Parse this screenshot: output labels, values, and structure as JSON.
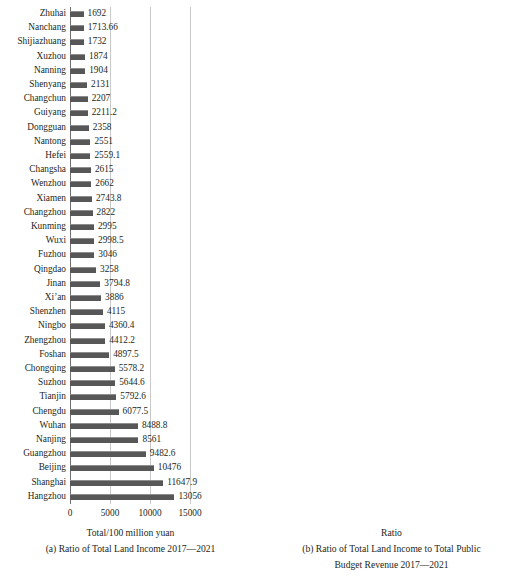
{
  "figure": {
    "width": 522,
    "height": 581,
    "bar_color": "#575757",
    "grid_color": "#c9c9c9",
    "axis_color": "#6f6f6f",
    "background": "#ffffff"
  },
  "chart_data": [
    {
      "type": "bar",
      "orientation": "horizontal",
      "panel": "a",
      "title": "",
      "xlabel": "Total/100 million yuan",
      "ylabel": "",
      "caption": "(a) Ratio of Total Land Income 2017—2021",
      "caption_line2": "",
      "xlim": [
        0,
        15000
      ],
      "xticks": [
        0,
        5000,
        10000,
        15000
      ],
      "xticklabels": [
        "0",
        "5000",
        "10000",
        "15000"
      ],
      "grid": true,
      "legend": "none",
      "categories": [
        "Zhuhai",
        "Nanchang",
        "Shijiazhuang",
        "Xuzhou",
        "Nanning",
        "Shenyang",
        "Changchun",
        "Guiyang",
        "Dongguan",
        "Nantong",
        "Hefei",
        "Changsha",
        "Wenzhou",
        "Xiamen",
        "Changzhou",
        "Kunming",
        "Wuxi",
        "Fuzhou",
        "Qingdao",
        "Jinan",
        "Xi’an",
        "Shenzhen",
        "Ningbo",
        "Zhengzhou",
        "Foshan",
        "Chongqing",
        "Suzhou",
        "Tianjin",
        "Chengdu",
        "Wuhan",
        "Nanjing",
        "Guangzhou",
        "Beijing",
        "Shanghai",
        "Hangzhou"
      ],
      "values": [
        1692,
        1713.66,
        1732,
        1874,
        1904,
        2131,
        2207,
        2211.2,
        2358,
        2551,
        2559.1,
        2615,
        2662,
        2743.8,
        2822,
        2995,
        2998.5,
        3046,
        3258,
        3794.8,
        3886,
        4115,
        4360.4,
        4412.2,
        4897.5,
        5578.2,
        5644.6,
        5792.6,
        6077.5,
        8488.8,
        8561,
        9482.6,
        10476,
        11647.9,
        13056
      ],
      "value_labels": [
        "1692",
        "1713.66",
        "1732",
        "1874",
        "1904",
        "2131",
        "2207",
        "2211.2",
        "2358",
        "2551",
        "2559.1",
        "2615",
        "2662",
        "2743.8",
        "2822",
        "2995",
        "2998.5",
        "3046",
        "3258",
        "3794.8",
        "3886",
        "4115",
        "4360.4",
        "4412.2",
        "4897.5",
        "5578.2",
        "5644.6",
        "5792.6",
        "6077.5",
        "8488.8",
        "8561",
        "9482.6",
        "10476",
        "11647.9",
        "13056"
      ]
    },
    {
      "type": "bar",
      "orientation": "horizontal",
      "panel": "b",
      "title": "",
      "xlabel": "Ratio",
      "ylabel": "",
      "caption": "(b) Ratio of Total Land Income to Total Public",
      "caption_line2": "Budget Revenue 2017—2021",
      "xlim": [
        0,
        1.5
      ],
      "xticks": [
        0,
        0.5,
        1.0,
        1.5
      ],
      "xticklabels": [
        "0.00",
        "0.50",
        "1.00",
        "1.50"
      ],
      "grid": true,
      "legend": "none",
      "categories": [
        "Shenzhen",
        "Shanghai",
        "Beijing",
        "Chongqing",
        "Suzhou",
        "Qingdao",
        "Changsha",
        "Tianjin",
        "Wuxi",
        "Shenyang",
        "Ningbo",
        "Shijiazhuang",
        "Dongguan",
        "Xiamen",
        "Xuzhou",
        "Zhengzhou",
        "Nanchang",
        "Nantong",
        "Hefei",
        "Chengdu",
        "Fuzhou",
        "Jinan",
        "Zhuhai",
        "Wenzhou",
        "Changzhou",
        "Kunming",
        "Changchun",
        "Nanning",
        "Xi’an",
        "Guiyang",
        "Nanjing",
        "Guangzhou",
        "Wuhan",
        "Hangzhou",
        "Foshan"
      ],
      "values": [
        0.22,
        0.33,
        0.37,
        0.51,
        0.51,
        0.52,
        0.53,
        0.53,
        0.57,
        0.59,
        0.6,
        0.61,
        0.7,
        0.71,
        0.75,
        0.75,
        0.75,
        0.81,
        0.82,
        0.82,
        0.89,
        0.9,
        0.93,
        0.93,
        0.95,
        0.96,
        1.01,
        1.04,
        1.07,
        1.09,
        1.11,
        1.12,
        1.16,
        1.33,
        1.34
      ],
      "value_labels": [
        "0.22",
        "0.33",
        "0.37",
        "0.51",
        "0.51",
        "0.52",
        "0.53",
        "0.53",
        "0.57",
        "0.59",
        "0.60",
        "0.61",
        "0.70",
        "0.71",
        "0.75",
        "0.75",
        "0.75",
        "0.81",
        "0.82",
        "0.82",
        "0.89",
        "0.90",
        "0.93",
        "0.93",
        "0.95",
        "0.96",
        "1.01",
        "1.04",
        "1.07",
        "1.09",
        "1.11",
        "1.12",
        "1.16",
        "1.33",
        "1.34"
      ]
    }
  ]
}
